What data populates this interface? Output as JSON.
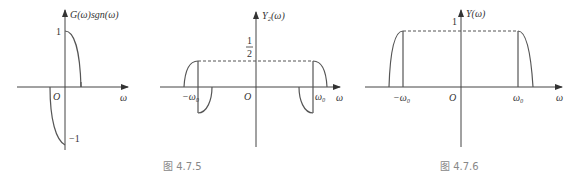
{
  "figures": [
    {
      "id": "fig-gsgn",
      "ylabel": "G(ω)sgn(ω)",
      "xlabel": "ω",
      "origin": "O",
      "tick_pos": "1",
      "tick_neg": "−1"
    },
    {
      "id": "fig-4-7-5",
      "ylabel": "Y₂(ω)",
      "xlabel": "ω",
      "origin": "O",
      "half_num": "1",
      "half_den": "2",
      "neg_w0": "−ω₀",
      "pos_w0": "ω₀",
      "caption": "图 4.7.5"
    },
    {
      "id": "fig-4-7-6",
      "ylabel": "Y(ω)",
      "xlabel": "ω",
      "left_xlabel": "ω",
      "origin": "O",
      "tick_one": "1",
      "neg_w0": "−ω₀",
      "pos_w0": "ω₀",
      "caption": "图 4.7.6"
    }
  ]
}
